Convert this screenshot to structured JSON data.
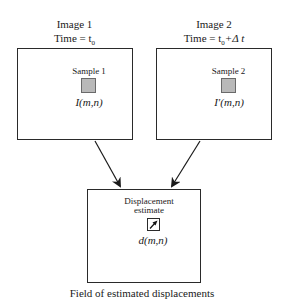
{
  "image1": {
    "title": "Image 1",
    "time_label": "Time = t",
    "time_sub": "0",
    "sample_label": "Sample 1",
    "function_label": "I(m,n)"
  },
  "image2": {
    "title": "Image 2",
    "time_label": "Time = t",
    "time_sub": "0",
    "time_suffix": "+Δ t",
    "sample_label": "Sample 2",
    "function_label": "I′(m,n)"
  },
  "result": {
    "estimate_label_line1": "Displacement",
    "estimate_label_line2": "estimate",
    "function_label": "d(m,n)",
    "caption": "Field of estimated displacements"
  },
  "icons": {
    "sample_square": "gray-filled-square",
    "displacement_vector": "arrow-up-right",
    "flow_arrows": "arrow-down"
  },
  "colors": {
    "line": "#2a2a2a",
    "sample_fill": "#b9b9b9",
    "background": "#ffffff"
  }
}
